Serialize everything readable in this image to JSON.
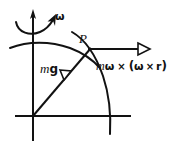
{
  "figure": {
    "name": "rotating-earth-effective-gravity-diagram",
    "background_color": "#ffffff",
    "stroke_color": "#121212",
    "labels": {
      "omega": "ω",
      "point_p": "P",
      "gravity_m": "m",
      "gravity_g": "g",
      "force_m": "m",
      "force_omega1": "ω",
      "force_times1": "×",
      "force_open_paren": "(",
      "force_omega2": "ω",
      "force_times2": "×",
      "force_r": "r",
      "force_close_paren": ")"
    },
    "elements": {
      "vertical_axis": "rotation-axis-arrow",
      "horizontal_axis": "equatorial-axis",
      "spin_arrow": "curved-rotation-arrow",
      "meridian_arc": "earth-surface-arc",
      "latitude_arc": "upper-surface-arc",
      "radius_line": "radius-to-point-p",
      "centrifugal_vector": "centrifugal-force-arrow",
      "gravity_vector": "gravity-force-arrowhead"
    },
    "geometry": {
      "origin_x": 33,
      "origin_y": 116,
      "point_p_x": 90,
      "point_p_y": 49,
      "axis_top_y": 10,
      "axis_bottom_y": 140,
      "h_axis_left_x": 15,
      "h_axis_right_x": 131,
      "force_arrow_start_x": 91,
      "force_arrow_end_x": 147,
      "force_arrow_y": 49
    }
  }
}
